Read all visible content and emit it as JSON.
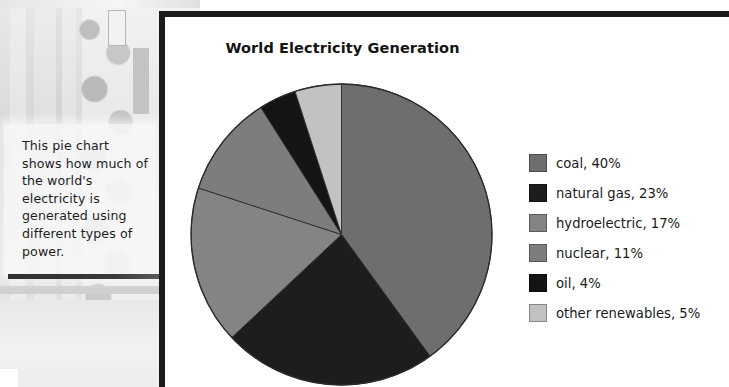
{
  "page": {
    "background_image_description": "faded grayscale photo of a building facade with foliage"
  },
  "caption": {
    "text": "This pie chart shows how much of the world's electricity is generated using different types of power."
  },
  "chart_panel": {
    "title": "World Electricity Generation"
  },
  "chart_data": {
    "type": "pie",
    "title": "World Electricity Generation",
    "xlabel": "",
    "ylabel": "",
    "legend_position": "right",
    "grid": false,
    "start_angle_deg": 0,
    "direction": "clockwise",
    "units": "%",
    "categories": [
      "coal",
      "natural gas",
      "hydroelectric",
      "nuclear",
      "oil",
      "other renewables"
    ],
    "values": [
      40,
      23,
      17,
      11,
      4,
      5
    ],
    "colors": [
      "#6e6e6e",
      "#1d1d1d",
      "#848484",
      "#7d7d7d",
      "#141414",
      "#c2c2c2"
    ],
    "slices": [
      {
        "label": "coal",
        "value": 40,
        "color": "#6e6e6e",
        "legend_text": "coal, 40%"
      },
      {
        "label": "natural gas",
        "value": 23,
        "color": "#1d1d1d",
        "legend_text": "natural gas, 23%"
      },
      {
        "label": "hydroelectric",
        "value": 17,
        "color": "#848484",
        "legend_text": "hydroelectric, 17%"
      },
      {
        "label": "nuclear",
        "value": 11,
        "color": "#7d7d7d",
        "legend_text": "nuclear, 11%"
      },
      {
        "label": "oil",
        "value": 4,
        "color": "#141414",
        "legend_text": "oil, 4%"
      },
      {
        "label": "other renewables",
        "value": 5,
        "color": "#c2c2c2",
        "legend_text": "other renewables, 5%"
      }
    ]
  },
  "legend": {
    "items": [
      {
        "label": "coal, 40%",
        "color": "#6e6e6e"
      },
      {
        "label": "natural gas, 23%",
        "color": "#1d1d1d"
      },
      {
        "label": "hydroelectric, 17%",
        "color": "#848484"
      },
      {
        "label": "nuclear, 11%",
        "color": "#7d7d7d"
      },
      {
        "label": "oil, 4%",
        "color": "#141414"
      },
      {
        "label": "other renewables, 5%",
        "color": "#c2c2c2"
      }
    ]
  }
}
